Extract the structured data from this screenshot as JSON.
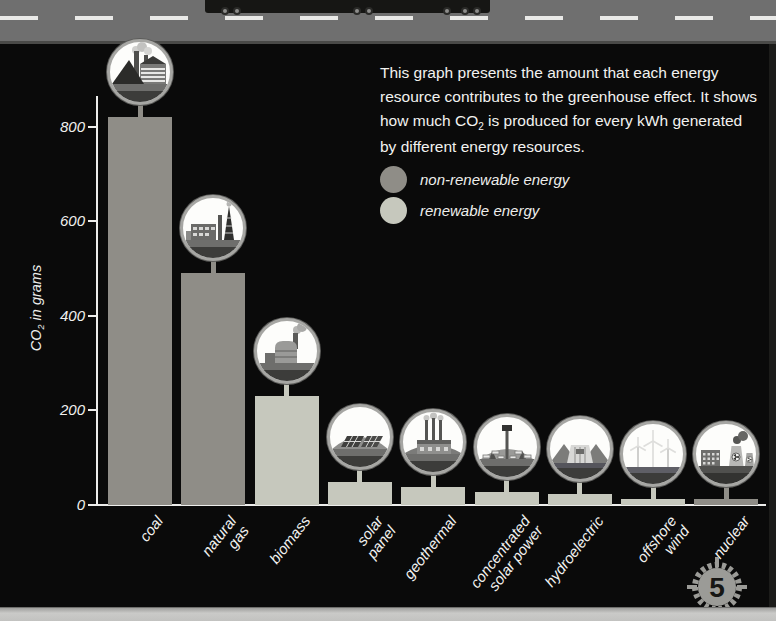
{
  "page": {
    "number": "5",
    "road_color": "#6f6f6f",
    "background_color": "#0a0a0a"
  },
  "description": {
    "part1": "This graph presents the amount that each energy resource contributes to the greenhouse effect. It shows how much CO",
    "sub": "2",
    "part2": " is produced for every kWh generated by different energy resources."
  },
  "legend": [
    {
      "label": "non-renewable energy",
      "color": "#8f8d87"
    },
    {
      "label": "renewable energy",
      "color": "#c6c8bd"
    }
  ],
  "chart_data": {
    "type": "bar",
    "title": "",
    "ylabel_parts": {
      "pre": "CO",
      "sub": "2",
      "post": " in grams"
    },
    "yticks": [
      0,
      200,
      400,
      600,
      800
    ],
    "ylim": [
      0,
      870
    ],
    "grid": false,
    "categories": [
      "coal",
      "natural\ngas",
      "biomass",
      "solar\npanel",
      "geothermal",
      "concentrated\nsolar power",
      "hydroelectric",
      "offshore\nwind",
      "nuclear"
    ],
    "values": [
      820,
      490,
      230,
      48,
      38,
      27,
      24,
      12,
      12
    ],
    "renewable": [
      false,
      false,
      true,
      true,
      true,
      true,
      true,
      true,
      false
    ],
    "icons": [
      "coal-plant-icon",
      "gas-refinery-icon",
      "biomass-plant-icon",
      "solar-panel-icon",
      "geothermal-plant-icon",
      "csp-tower-icon",
      "hydro-dam-icon",
      "offshore-wind-icon",
      "nuclear-plant-icon"
    ],
    "colors": {
      "non_renewable": "#8f8d87",
      "renewable": "#c6c8bd",
      "axis": "#ededeb",
      "text": "#f0f0ee"
    }
  }
}
